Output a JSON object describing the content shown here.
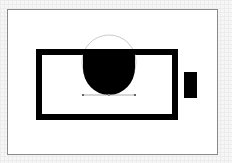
{
  "canvas": {
    "width": 232,
    "height": 163,
    "artboard": {
      "x": 7,
      "y": 9,
      "width": 211,
      "height": 146,
      "border_color": "#8a8a8a",
      "fill": "#ffffff"
    }
  },
  "shapes": {
    "battery_body": {
      "x": 39,
      "y": 52,
      "width": 136,
      "height": 65,
      "stroke_width": 6,
      "stroke_color": "#000000"
    },
    "battery_terminal": {
      "x": 184,
      "y": 72,
      "width": 13,
      "height": 26,
      "fill": "#000000"
    },
    "fill_shape": {
      "left": 83,
      "right": 135,
      "top": 49,
      "bottom": 95,
      "fill": "#000000"
    },
    "selection_circle": {
      "cx": 109,
      "cy": 62,
      "r": 27,
      "stroke_color": "#b8b8b8"
    },
    "selection_baseline": {
      "x1": 83,
      "x2": 135,
      "y": 95,
      "stroke_color": "#999999"
    }
  }
}
